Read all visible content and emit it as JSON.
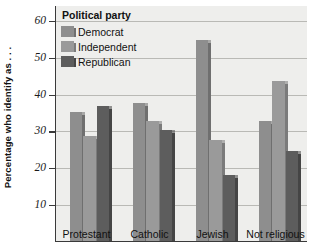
{
  "chart_data": {
    "type": "bar",
    "title": "",
    "xlabel": "",
    "ylabel": "Percentage who identify as . . .",
    "ylim": [
      0,
      64
    ],
    "yticks": [
      10,
      20,
      30,
      40,
      50,
      60
    ],
    "ytick_labels": [
      "10",
      "20",
      "30",
      "40",
      "50",
      "60"
    ],
    "grid": true,
    "legend_position": "top-left",
    "legend_title": "Political party",
    "categories": [
      "Protestant",
      "Catholic",
      "Jewish",
      "Not religious"
    ],
    "series": [
      {
        "name": "Democrat",
        "color": "#8e8e8e",
        "side_color": "#6f6f6f",
        "values": [
          35.0,
          37.5,
          54.5,
          32.5
        ]
      },
      {
        "name": "Independent",
        "color": "#9a9a9a",
        "side_color": "#7b7b7b",
        "values": [
          28.5,
          32.5,
          27.5,
          43.5
        ]
      },
      {
        "name": "Republican",
        "color": "#5d5d5d",
        "side_color": "#454545",
        "values": [
          36.5,
          30.0,
          18.0,
          24.5
        ]
      }
    ]
  },
  "axis": {
    "y_title": "Percentage who identify as . . ."
  },
  "legend": {
    "title": "Political party",
    "items": [
      {
        "label": "Democrat"
      },
      {
        "label": "Independent"
      },
      {
        "label": "Republican"
      }
    ]
  },
  "style": {
    "plot_background": "#eeeeec",
    "grid_color": "#b9b9b5",
    "axis_color": "#3a3a3a",
    "text_color": "#111111",
    "page_background": "#ffffff"
  }
}
